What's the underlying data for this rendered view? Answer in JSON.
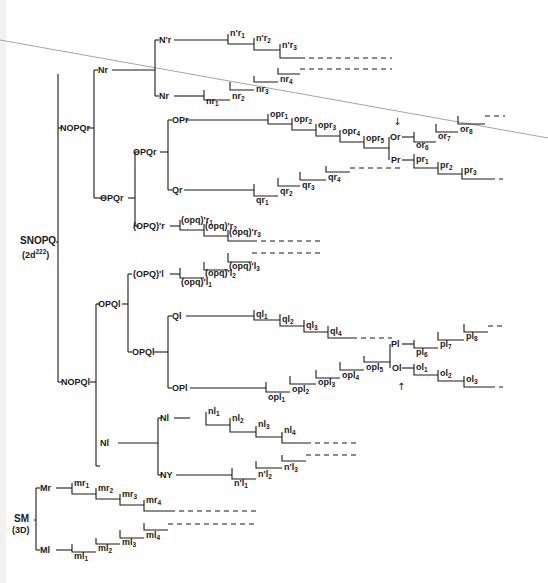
{
  "roots": {
    "snopq": {
      "label": "SNOPQ",
      "sub_label": "(2d",
      "sub_sup": "222",
      "sub_end": ")"
    },
    "sm": {
      "label": "SM",
      "sub_label": "(3D)"
    }
  },
  "nodes": {
    "nopq_r": "NOPQr",
    "nopq_l": "NOPQl",
    "n_r": "Nr",
    "n_prime_r": "N'r",
    "n_r2": "Nr",
    "opq_r": "OPQr",
    "opq_r_inner": "OPQr",
    "op_r": "OPr",
    "q_r": "Qr",
    "opq_prime_r": "(OPQ)'r",
    "o_r": "Or",
    "p_r": "Pr",
    "opq_l": "OPQl",
    "opq_prime_l": "(OPQ)'l",
    "opq_l_inner": "OPQl",
    "q_l": "Ql",
    "op_l": "OPl",
    "p_l": "Pl",
    "o_l": "Ol",
    "n_l": "Nl",
    "n_l2": "Nl",
    "n_y": "NY",
    "m_r": "Mr",
    "m_l": "Ml"
  },
  "teloblast_series": {
    "n_prime_r": [
      "n'r1",
      "n'r2",
      "n'r3"
    ],
    "n_r": [
      "nr1",
      "nr2",
      "nr3",
      "nr4"
    ],
    "op_r": [
      "opr1",
      "opr2",
      "opr3",
      "opr4",
      "opr5"
    ],
    "o_r": [
      "or6",
      "or7",
      "or8"
    ],
    "p_r": [
      "pr1",
      "pr2",
      "pr3"
    ],
    "q_r": [
      "qr1",
      "qr2",
      "qr3",
      "qr4"
    ],
    "opq_prime_r": [
      "(opq)'r1",
      "(opq)'r2",
      "(opq)'r3"
    ],
    "opq_prime_l": [
      "(opq)'l1",
      "(opq)'l2",
      "(opq)'l3"
    ],
    "q_l": [
      "ql1",
      "ql2",
      "ql3",
      "ql4"
    ],
    "op_l": [
      "opl1",
      "opl2",
      "opl3",
      "opl4",
      "opl5"
    ],
    "p_l": [
      "pl6",
      "pl7",
      "pl8"
    ],
    "o_l": [
      "ol1",
      "ol2",
      "ol3"
    ],
    "n_l": [
      "nl1",
      "nl2",
      "nl3",
      "nl4"
    ],
    "n_prime_l": [
      "n'l1",
      "n'l2",
      "n'l3"
    ],
    "m_r": [
      "mr1",
      "mr2",
      "mr3",
      "mr4"
    ],
    "m_l": [
      "ml1",
      "ml2",
      "ml3",
      "ml4"
    ]
  },
  "markers": {
    "arrow_down": "↓",
    "arrow_up": "↑"
  }
}
